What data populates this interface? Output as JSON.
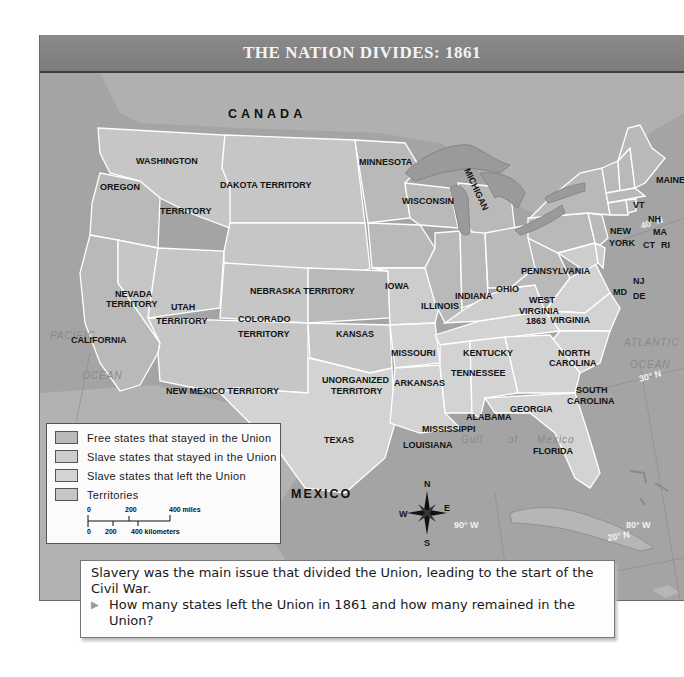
{
  "map": {
    "title": "THE NATION DIVIDES: 1861",
    "colors": {
      "frame_bg": "#a9a9a9",
      "title_bar": "#828282",
      "ocean": "#a4a4a4",
      "foreign_land": "#b2b2b2",
      "free_states": "#b9b9b9",
      "slave_union": "#cdcdcd",
      "slave_left": "#d3d3d3",
      "territories": "#c6c6c6",
      "borders": "#ffffff",
      "lakes": "#9a9a9a"
    },
    "countries": {
      "canada": "CANADA",
      "mexico": "MEXICO"
    },
    "water_labels": {
      "pacific_1": "PACIFIC",
      "pacific_2": "OCEAN",
      "atlantic_1": "ATLANTIC",
      "atlantic_2": "OCEAN",
      "gulf_1": "Gulf",
      "gulf_2": "of",
      "gulf_3": "Mexico"
    },
    "coordinates": {
      "lon_120": "120° W",
      "lat_40": "40° N",
      "lat_30": "30° N",
      "lon_90": "90° W",
      "lon_80": "80° W",
      "lat_20": "20° N"
    },
    "compass": {
      "n": "N",
      "s": "S",
      "e": "E",
      "w": "W"
    },
    "regions": {
      "washington": "WASHINGTON",
      "washington_territory": "TERRITORY",
      "oregon": "OREGON",
      "dakota": "DAKOTA TERRITORY",
      "minnesota": "MINNESOTA",
      "wisconsin": "WISCONSIN",
      "michigan": "MICHIGAN",
      "maine": "MAINE",
      "vt": "VT",
      "nh": "NH",
      "ma": "MA",
      "ct": "CT",
      "ri": "RI",
      "new_york_1": "NEW",
      "new_york_2": "YORK",
      "pennsylvania": "PENNSYLVANIA",
      "nj": "NJ",
      "de": "DE",
      "md": "MD",
      "nevada_1": "NEVADA",
      "nevada_2": "TERRITORY",
      "utah_1": "UTAH",
      "utah_2": "TERRITORY",
      "nebraska": "NEBRASKA TERRITORY",
      "iowa": "IOWA",
      "illinois": "ILLINOIS",
      "indiana": "INDIANA",
      "ohio": "OHIO",
      "west_virginia_1": "WEST",
      "west_virginia_2": "VIRGINIA",
      "west_virginia_3": "1863",
      "virginia": "VIRGINIA",
      "california": "CALIFORNIA",
      "colorado_1": "COLORADO",
      "colorado_2": "TERRITORY",
      "kansas": "KANSAS",
      "missouri": "MISSOURI",
      "kentucky": "KENTUCKY",
      "north_carolina_1": "NORTH",
      "north_carolina_2": "CAROLINA",
      "tennessee": "TENNESSEE",
      "unorganized_1": "UNORGANIZED",
      "unorganized_2": "TERRITORY",
      "arkansas": "ARKANSAS",
      "south_carolina_1": "SOUTH",
      "south_carolina_2": "CAROLINA",
      "new_mexico": "NEW MEXICO TERRITORY",
      "georgia": "GEORGIA",
      "alabama": "ALABAMA",
      "mississippi": "MISSISSIPPI",
      "texas": "TEXAS",
      "louisiana": "LOUISIANA",
      "florida": "FLORIDA"
    }
  },
  "legend": {
    "items": [
      {
        "label": "Free states that stayed in the Union",
        "color": "#b9b9b9"
      },
      {
        "label": "Slave states that stayed in the Union",
        "color": "#cdcdcd"
      },
      {
        "label": "Slave states that left the Union",
        "color": "#d3d3d3"
      },
      {
        "label": "Territories",
        "color": "#c6c6c6"
      }
    ],
    "scale": {
      "miles_0": "0",
      "miles_200": "200",
      "miles_400": "400 miles",
      "km_0": "0",
      "km_200": "200",
      "km_400": "400 kilometers"
    }
  },
  "caption": {
    "text": "Slavery was the main issue that divided the Union, leading to the start of the Civil War.",
    "question": "How many states left the Union in 1861 and how many remained in the Union?"
  }
}
